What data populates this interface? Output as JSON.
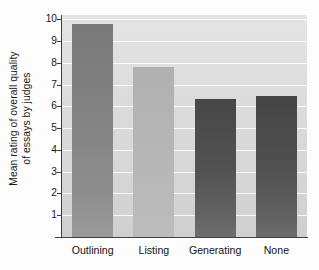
{
  "chart_data": {
    "type": "bar",
    "title": "",
    "subtitle": "",
    "xlabel": "",
    "ylabel": "Mean rating of overall quality of essays by judges",
    "ylabel_lines": [
      "Mean rating of overall quality",
      "of essays by judges"
    ],
    "categories": [
      "Outlining",
      "Listing",
      "Generating",
      "None"
    ],
    "values": [
      9.8,
      7.8,
      6.35,
      6.5
    ],
    "ylim": [
      0,
      10.2
    ],
    "yticks": [
      1,
      2,
      3,
      4,
      5,
      6,
      7,
      8,
      9,
      10
    ],
    "ytick_labels": [
      "1",
      "2",
      "3",
      "4",
      "5",
      "6",
      "7",
      "8",
      "9",
      "10"
    ],
    "grid": "horizontal",
    "legend": "none",
    "bar_colors": [
      "#838383",
      "#b6b6b6",
      "#525252",
      "#505050"
    ],
    "plot_background": "#dcdcdc",
    "gridline_color": "#ffffff",
    "axis_color": "#3f3f3f"
  },
  "axis": {
    "ytitle_line1": "Mean rating of overall quality",
    "ytitle_line2": "of essays by judges"
  }
}
